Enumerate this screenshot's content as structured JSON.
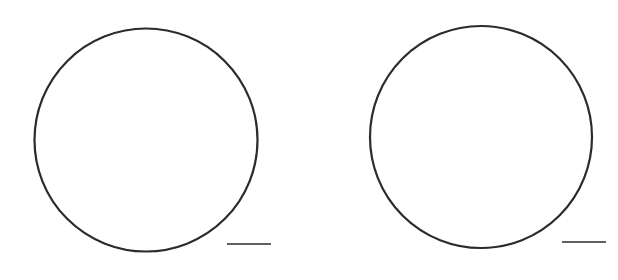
{
  "figure": {
    "width": 618,
    "height": 280,
    "background": "#ffffff",
    "stroke_color": "#2b2b2b",
    "panels": [
      {
        "name": "left",
        "circle": {
          "cx": 146,
          "cy": 140,
          "r": 111.5,
          "stroke_width": 2.2
        },
        "scale_bar": {
          "x1": 227,
          "x2": 271,
          "y": 244,
          "stroke_width": 1.6
        }
      },
      {
        "name": "right",
        "circle": {
          "cx": 481,
          "cy": 137,
          "r": 111,
          "stroke_width": 2.2
        },
        "scale_bar": {
          "x1": 562,
          "x2": 606,
          "y": 242,
          "stroke_width": 1.6
        }
      }
    ]
  }
}
